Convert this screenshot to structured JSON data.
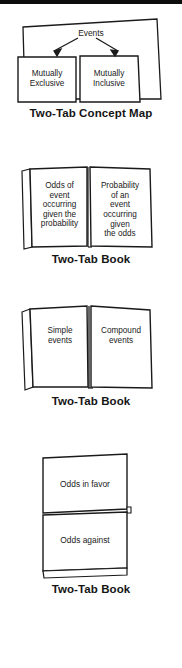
{
  "page": {
    "background_color": "#ffffff",
    "ink_color": "#1a1a1a",
    "top_rule_color": "#0d0d0d"
  },
  "figures": [
    {
      "id": "two-tab-concept-map",
      "type": "two-tab-concept-map",
      "caption": "Two-Tab Concept Map",
      "header_label": "Events",
      "tabs": [
        {
          "label": "Mutually\nExclusive",
          "lines": [
            "Mutually",
            "Exclusive"
          ]
        },
        {
          "label": "Mutually\nInclusive",
          "lines": [
            "Mutually",
            "Inclusive"
          ]
        }
      ],
      "arrows": 2
    },
    {
      "id": "two-tab-book-odds-probability",
      "type": "two-tab-book",
      "caption": "Two-Tab Book",
      "tabs": [
        {
          "label": "Odds of event occurring given the probability",
          "lines": [
            "Odds of",
            "event",
            "occurring",
            "given the",
            "probability"
          ]
        },
        {
          "label": "Probability of an event occurring given the odds",
          "lines": [
            "Probability",
            "of an",
            "event",
            "occurring",
            "given",
            "the odds"
          ]
        }
      ]
    },
    {
      "id": "two-tab-book-simple-compound",
      "type": "two-tab-book",
      "caption": "Two-Tab Book",
      "tabs": [
        {
          "label": "Simple events",
          "lines": [
            "Simple",
            "events"
          ]
        },
        {
          "label": "Compound events",
          "lines": [
            "Compound",
            "events"
          ]
        }
      ]
    },
    {
      "id": "two-tab-book-odds-favor-against",
      "type": "two-tab-book-stacked",
      "caption": "Two-Tab Book",
      "tabs": [
        {
          "label": "Odds in favor",
          "lines": [
            "Odds in favor"
          ]
        },
        {
          "label": "Odds against",
          "lines": [
            "Odds against"
          ]
        }
      ]
    }
  ]
}
